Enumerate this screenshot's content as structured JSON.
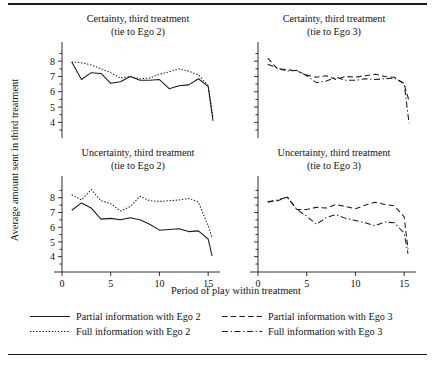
{
  "figure": {
    "y_axis_title": "Average amount sent in third treatment",
    "x_axis_title": "Period of play within treatment"
  },
  "legend": {
    "items": [
      {
        "label": "Partial information with Ego 2",
        "style": "solid"
      },
      {
        "label": "Partial information with Ego 3",
        "style": "dashed"
      },
      {
        "label": "Full information with Ego 2",
        "style": "dotted"
      },
      {
        "label": "Full information with Ego 3",
        "style": "dashdot"
      }
    ]
  },
  "chart_data": [
    {
      "type": "line",
      "panel": "top-left",
      "title": "Certainty, third treatment",
      "subtitle": "(tie to Ego 2)",
      "xlabel": "Period of play within treatment",
      "ylabel": "Average amount sent in third treatment",
      "xlim": [
        0,
        15.6
      ],
      "ylim": [
        3.5,
        8.6
      ],
      "xticks": [
        0,
        5,
        10,
        15
      ],
      "yticks": [
        4,
        5,
        6,
        7,
        8
      ],
      "grid": false,
      "x": [
        1,
        2,
        3,
        4,
        5,
        6,
        7,
        8,
        9,
        10,
        11,
        12,
        13,
        14,
        15
      ],
      "series": [
        {
          "name": "Partial information with Ego 2",
          "style": "solid",
          "values": [
            7.95,
            6.8,
            7.25,
            7.2,
            6.55,
            6.65,
            7.0,
            6.75,
            6.75,
            6.8,
            6.2,
            6.4,
            6.45,
            6.85,
            6.35
          ]
        },
        {
          "name": "Full information with Ego 2",
          "style": "dotted",
          "values": [
            7.95,
            7.9,
            7.75,
            7.5,
            7.25,
            6.9,
            7.0,
            6.85,
            6.9,
            7.15,
            7.3,
            7.5,
            7.35,
            7.1,
            6.4
          ]
        }
      ],
      "endpoint_drop": {
        "x": 15.5,
        "partial": 4.1,
        "full": 4.35
      }
    },
    {
      "type": "line",
      "panel": "top-right",
      "title": "Certainty, third treatment",
      "subtitle": "(tie to Ego 3)",
      "xlabel": "Period of play within treatment",
      "ylabel": "Average amount sent in third treatment",
      "xlim": [
        0,
        15.6
      ],
      "ylim": [
        3.5,
        8.6
      ],
      "xticks": [
        0,
        5,
        10,
        15
      ],
      "yticks": [
        4,
        5,
        6,
        7,
        8
      ],
      "grid": false,
      "x": [
        1,
        2,
        3,
        4,
        5,
        6,
        7,
        8,
        9,
        10,
        11,
        12,
        13,
        14,
        15
      ],
      "series": [
        {
          "name": "Partial information with Ego 3",
          "style": "dashed",
          "values": [
            8.2,
            7.5,
            7.45,
            7.35,
            7.1,
            6.95,
            7.05,
            6.8,
            7.0,
            6.95,
            7.05,
            7.15,
            7.0,
            6.95,
            6.5
          ]
        },
        {
          "name": "Full information with Ego 3",
          "style": "dashdot",
          "values": [
            7.8,
            7.55,
            7.35,
            7.4,
            7.05,
            6.6,
            6.7,
            6.95,
            6.75,
            6.75,
            6.85,
            6.8,
            6.85,
            6.9,
            6.55
          ]
        }
      ],
      "endpoint_drop": {
        "x": 15.5,
        "partial": 5.4,
        "full": 3.95
      }
    },
    {
      "type": "line",
      "panel": "bottom-left",
      "title": "Uncertainty, third treatment",
      "subtitle": "(tie to Ego 2)",
      "xlabel": "Period of play within treatment",
      "ylabel": "Average amount sent in third treatment",
      "xlim": [
        0,
        15.6
      ],
      "ylim": [
        3.5,
        8.8
      ],
      "xticks": [
        0,
        5,
        10,
        15
      ],
      "yticks": [
        4,
        5,
        6,
        7,
        8
      ],
      "grid": false,
      "x": [
        1,
        2,
        3,
        4,
        5,
        6,
        7,
        8,
        9,
        10,
        11,
        12,
        13,
        14,
        15
      ],
      "series": [
        {
          "name": "Partial information with Ego 2",
          "style": "solid",
          "values": [
            7.15,
            7.65,
            7.3,
            6.55,
            6.6,
            6.5,
            6.65,
            6.5,
            6.2,
            5.8,
            5.85,
            5.9,
            5.7,
            5.75,
            5.2
          ]
        },
        {
          "name": "Full information with Ego 2",
          "style": "dotted",
          "values": [
            8.2,
            7.85,
            8.55,
            7.8,
            7.6,
            7.1,
            7.4,
            8.1,
            7.8,
            7.75,
            7.8,
            7.85,
            7.95,
            7.7,
            6.1
          ]
        }
      ],
      "endpoint_drop": {
        "x": 15.4,
        "partial": 4.05,
        "full": 5.25
      }
    },
    {
      "type": "line",
      "panel": "bottom-right",
      "title": "Uncertainty, third treatment",
      "subtitle": "(tie to Ego 3)",
      "xlabel": "Period of play within treatment",
      "ylabel": "Average amount sent in third treatment",
      "xlim": [
        0,
        15.6
      ],
      "ylim": [
        3.5,
        8.8
      ],
      "xticks": [
        0,
        5,
        10,
        15
      ],
      "yticks": [
        4,
        5,
        6,
        7,
        8
      ],
      "grid": false,
      "x": [
        1,
        2,
        3,
        4,
        5,
        6,
        7,
        8,
        9,
        10,
        11,
        12,
        13,
        14,
        15
      ],
      "series": [
        {
          "name": "Partial information with Ego 3",
          "style": "dashed",
          "values": [
            7.75,
            7.8,
            8.05,
            7.2,
            7.2,
            7.35,
            7.3,
            7.55,
            7.4,
            7.25,
            7.5,
            7.7,
            7.55,
            7.45,
            6.7
          ]
        },
        {
          "name": "Full information with Ego 3",
          "style": "dashdot",
          "values": [
            7.7,
            7.85,
            8.05,
            7.2,
            6.75,
            6.2,
            6.65,
            6.85,
            6.6,
            6.45,
            6.3,
            6.1,
            6.35,
            6.3,
            5.6
          ]
        }
      ],
      "endpoint_drop": {
        "x": 15.4,
        "partial": 4.5,
        "full": 4.2
      }
    }
  ]
}
